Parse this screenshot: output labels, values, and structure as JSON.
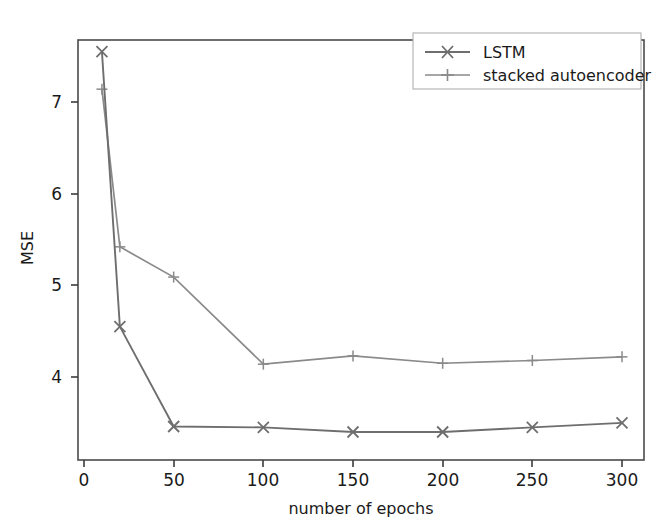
{
  "chart_data": {
    "type": "line",
    "title": "",
    "subtitle": "",
    "xlabel": "number of epochs",
    "ylabel": "MSE",
    "xlim": [
      0,
      312
    ],
    "ylim": [
      3.27,
      7.72
    ],
    "xticks": [
      0,
      50,
      100,
      150,
      200,
      250,
      300
    ],
    "xticklabels": [
      "0",
      "50",
      "100",
      "150",
      "200",
      "250",
      "300"
    ],
    "yticks": [
      4,
      5,
      6,
      7
    ],
    "yticklabels": [
      "4",
      "5",
      "6",
      "7"
    ],
    "grid": false,
    "legend_position": "upper right",
    "x": [
      10,
      20,
      50,
      100,
      150,
      200,
      250,
      300
    ],
    "series": [
      {
        "name": "LSTM",
        "marker": "x",
        "color": "#6e6e6e",
        "values": [
          7.55,
          4.55,
          3.46,
          3.45,
          3.4,
          3.4,
          3.45,
          3.5
        ]
      },
      {
        "name": "stacked autoencoder",
        "marker": "+",
        "color": "#8a8a8a",
        "values": [
          7.14,
          5.42,
          5.09,
          4.14,
          4.23,
          4.15,
          4.18,
          4.22
        ]
      }
    ]
  },
  "axes": {
    "xlabel": "number of epochs",
    "ylabel": "MSE"
  },
  "legend": {
    "entries": [
      {
        "label": "LSTM",
        "marker": "x"
      },
      {
        "label": "stacked autoencoder",
        "marker": "+"
      }
    ]
  },
  "colors": {
    "lstm_line": "#6e6e6e",
    "autoencoder_line": "#8a8a8a",
    "axis": "#3c3c3c",
    "text": "#1a1a1a",
    "background": "#ffffff"
  }
}
